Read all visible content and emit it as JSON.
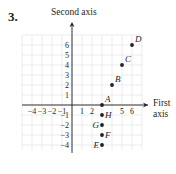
{
  "problem": {
    "number": "3."
  },
  "chart_data": {
    "type": "scatter",
    "title": "",
    "xlabel": "First axis",
    "ylabel": "Second axis",
    "xlim": [
      -5,
      7
    ],
    "ylim": [
      -4.5,
      7
    ],
    "grid": true,
    "x_ticks": [
      -4,
      -3,
      -2,
      -1,
      1,
      2,
      5,
      6
    ],
    "x_tick_labels": [
      "−4",
      "−3",
      "−2",
      "−1",
      "1",
      "2",
      "5",
      "6"
    ],
    "y_ticks": [
      6,
      5,
      4,
      3,
      2,
      1,
      -1,
      -2,
      -3,
      -4
    ],
    "y_tick_labels": [
      "6",
      "5",
      "4",
      "3",
      "2",
      "1",
      "−1",
      "−2",
      "−3",
      "−4"
    ],
    "points": [
      {
        "label": "A",
        "x": 3,
        "y": 0
      },
      {
        "label": "B",
        "x": 4,
        "y": 2
      },
      {
        "label": "C",
        "x": 5,
        "y": 4
      },
      {
        "label": "D",
        "x": 6,
        "y": 6
      },
      {
        "label": "E",
        "x": 3,
        "y": -4
      },
      {
        "label": "F",
        "x": 3,
        "y": -3
      },
      {
        "label": "G",
        "x": 3,
        "y": -2
      },
      {
        "label": "H",
        "x": 3,
        "y": -1
      }
    ],
    "colors": {
      "axis": "#231f20",
      "grid": "#e6e6e6",
      "point": "#231f20"
    }
  },
  "labels": {
    "first_axis_line1": "First",
    "first_axis_line2": "axis",
    "second_axis": "Second axis"
  }
}
